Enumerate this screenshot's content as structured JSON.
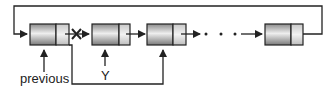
{
  "diagram": {
    "type": "circular-linked-list-deletion",
    "labels": {
      "previous": "previous",
      "y": "Y"
    },
    "nodes": [
      {
        "id": "n1",
        "role": "previous"
      },
      {
        "id": "n2",
        "role": "Y (deleted)"
      },
      {
        "id": "n3",
        "role": "next"
      },
      {
        "id": "n4",
        "role": "last"
      }
    ],
    "ellipsis": "· · ·",
    "broken_link_marker": "✕",
    "colors": {
      "stroke": "#222222",
      "node_light": "#e8e8e8",
      "node_dark": "#8a8a8a"
    }
  }
}
